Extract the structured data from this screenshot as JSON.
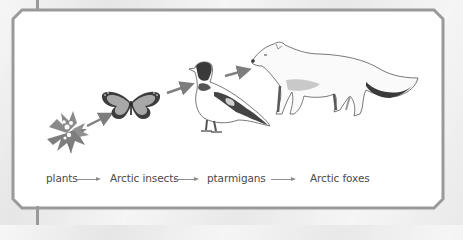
{
  "diagram": {
    "type": "food-chain",
    "organisms": [
      {
        "name": "plants",
        "icon": "flower-icon"
      },
      {
        "name": "Arctic insects",
        "icon": "butterfly-icon"
      },
      {
        "name": "ptarmigans",
        "icon": "ptarmigan-bird-icon"
      },
      {
        "name": "Arctic foxes",
        "icon": "arctic-fox-icon"
      }
    ],
    "labels": {
      "plants": "plants",
      "insects": "Arctic insects",
      "ptarmigans": "ptarmigans",
      "foxes": "Arctic foxes"
    },
    "connector": "arrow-right-icon",
    "colors": {
      "frame": "#9a9a9a",
      "panel": "#ffffff",
      "background": "#ececec",
      "arrow": "#8a8a8a",
      "illustration_gray": "#7a7a7a",
      "text": "#4a4a4a"
    }
  }
}
